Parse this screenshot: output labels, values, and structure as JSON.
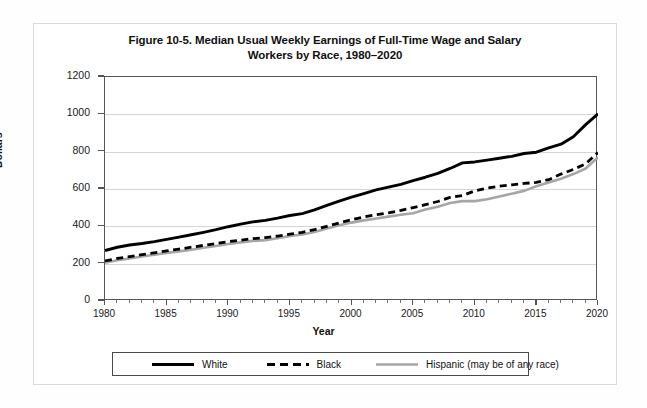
{
  "figure": {
    "title_line1": "Figure 10-5. Median Usual Weekly Earnings of Full-Time Wage and Salary",
    "title_line2": "Workers by Race, 1980–2020"
  },
  "axes": {
    "ylabel": "Dollars",
    "xlabel": "Year",
    "yticks": [
      "0",
      "200",
      "400",
      "600",
      "800",
      "1000",
      "1200"
    ],
    "xticks": [
      "1980",
      "1985",
      "1990",
      "1995",
      "2000",
      "2005",
      "2010",
      "2015",
      "2020"
    ]
  },
  "legend": {
    "items": [
      {
        "label": "White",
        "style": "solid",
        "color": "#000000"
      },
      {
        "label": "Black",
        "style": "dashed",
        "color": "#000000"
      },
      {
        "label": "Hispanic (may be of any race)",
        "style": "solid",
        "color": "#a6a6a6"
      }
    ]
  },
  "chart_data": {
    "type": "line",
    "title": "Figure 10-5. Median Usual Weekly Earnings of Full-Time Wage and Salary Workers by Race, 1980–2020",
    "xlabel": "Year",
    "ylabel": "Dollars",
    "xlim": [
      1980,
      2020
    ],
    "ylim": [
      0,
      1200
    ],
    "yticks": [
      0,
      200,
      400,
      600,
      800,
      1000,
      1200
    ],
    "xticks": [
      1980,
      1985,
      1990,
      1995,
      2000,
      2005,
      2010,
      2015,
      2020
    ],
    "grid": "horizontal",
    "legend_position": "below",
    "x": [
      1980,
      1981,
      1982,
      1983,
      1984,
      1985,
      1986,
      1987,
      1988,
      1989,
      1990,
      1991,
      1992,
      1993,
      1994,
      1995,
      1996,
      1997,
      1998,
      1999,
      2000,
      2001,
      2002,
      2003,
      2004,
      2005,
      2006,
      2007,
      2008,
      2009,
      2010,
      2011,
      2012,
      2013,
      2014,
      2015,
      2016,
      2017,
      2018,
      2019,
      2020
    ],
    "series": [
      {
        "name": "White",
        "style": "solid",
        "color": "#000000",
        "values": [
          270,
          288,
          300,
          308,
          318,
          330,
          342,
          355,
          368,
          382,
          398,
          412,
          424,
          432,
          444,
          458,
          468,
          488,
          512,
          535,
          556,
          575,
          595,
          610,
          625,
          645,
          663,
          684,
          710,
          740,
          745,
          755,
          765,
          775,
          790,
          797,
          820,
          840,
          880,
          945,
          1003
        ]
      },
      {
        "name": "Black",
        "style": "dashed",
        "color": "#000000",
        "values": [
          215,
          228,
          238,
          248,
          258,
          268,
          278,
          288,
          298,
          308,
          318,
          326,
          334,
          340,
          348,
          358,
          368,
          382,
          400,
          418,
          435,
          450,
          462,
          472,
          485,
          500,
          516,
          533,
          555,
          565,
          590,
          605,
          615,
          622,
          630,
          635,
          650,
          680,
          705,
          735,
          795
        ]
      },
      {
        "name": "Hispanic (may be of any race)",
        "style": "solid",
        "color": "#a6a6a6",
        "values": [
          205,
          218,
          228,
          238,
          248,
          258,
          266,
          275,
          285,
          295,
          305,
          314,
          322,
          326,
          336,
          348,
          356,
          370,
          388,
          406,
          420,
          432,
          442,
          452,
          462,
          470,
          490,
          505,
          525,
          535,
          535,
          545,
          560,
          575,
          590,
          615,
          635,
          655,
          680,
          710,
          770
        ]
      }
    ]
  }
}
